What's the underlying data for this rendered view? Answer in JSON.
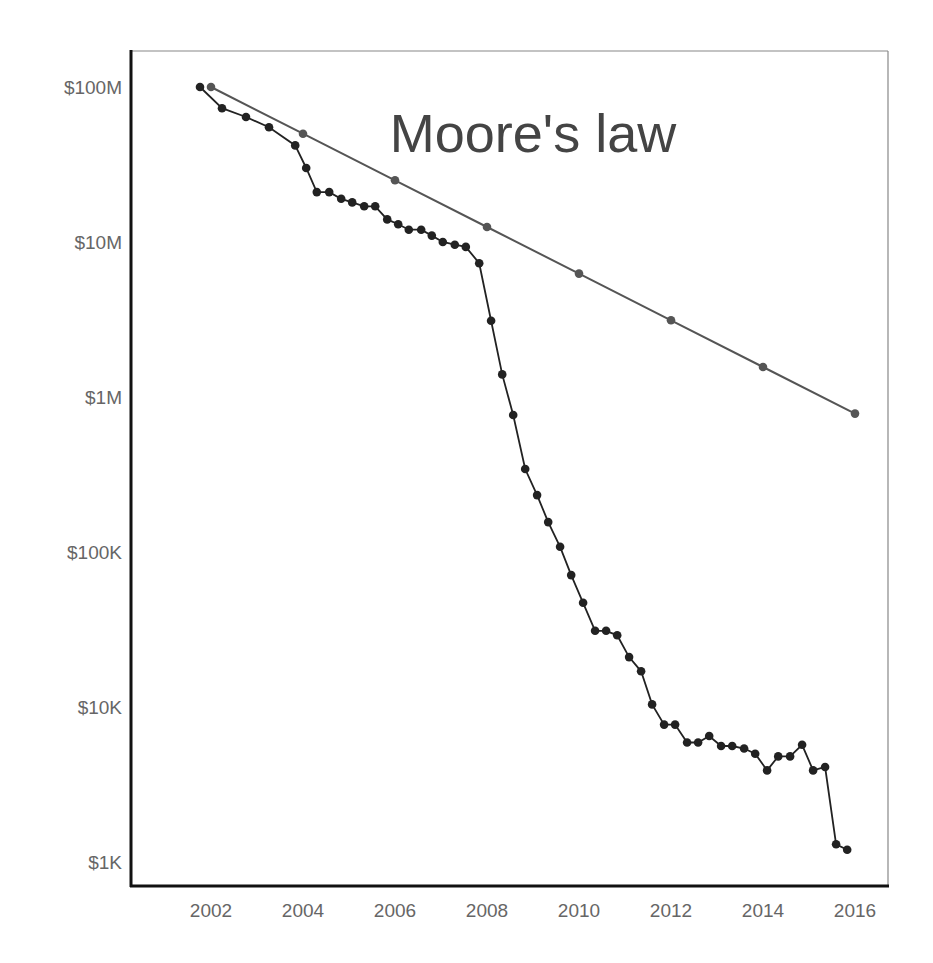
{
  "chart_data": {
    "type": "line",
    "title": "Moore's law",
    "xlabel": "",
    "ylabel": "",
    "yscale": "log",
    "xlim": [
      2000.6,
      2016.7
    ],
    "ylim": [
      900,
      160000000
    ],
    "grid": false,
    "legend": "none",
    "x_ticks": [
      2002,
      2004,
      2006,
      2008,
      2010,
      2012,
      2014,
      2016
    ],
    "x_tick_labels": [
      "2002",
      "2004",
      "2006",
      "2008",
      "2010",
      "2012",
      "2014",
      "2016"
    ],
    "y_ticks": [
      100000000,
      10000000,
      1000000,
      100000,
      10000,
      1000
    ],
    "y_tick_labels": [
      "$100M",
      "$10M",
      "$1M",
      "$100K",
      "$10K",
      "$1K"
    ],
    "series": [
      {
        "name": "Actual cost",
        "color": "#222222",
        "x": [
          2001.76,
          2002.24,
          2002.76,
          2003.26,
          2003.83,
          2004.07,
          2004.3,
          2004.57,
          2004.83,
          2005.07,
          2005.33,
          2005.57,
          2005.83,
          2006.07,
          2006.3,
          2006.57,
          2006.8,
          2007.04,
          2007.3,
          2007.54,
          2007.83,
          2008.09,
          2008.33,
          2008.57,
          2008.83,
          2009.09,
          2009.33,
          2009.59,
          2009.83,
          2010.09,
          2010.35,
          2010.59,
          2010.83,
          2011.09,
          2011.35,
          2011.59,
          2011.85,
          2012.09,
          2012.35,
          2012.59,
          2012.83,
          2013.09,
          2013.33,
          2013.59,
          2013.83,
          2014.09,
          2014.33,
          2014.59,
          2014.85,
          2015.09,
          2015.35,
          2015.59,
          2015.83
        ],
        "values": [
          100000000,
          73000000,
          64000000,
          55000000,
          42000000,
          30000000,
          21000000,
          21000000,
          19000000,
          18000000,
          17000000,
          17000000,
          14000000,
          13000000,
          12000000,
          12000000,
          11000000,
          10000000,
          9600000,
          9300000,
          7300000,
          3100000,
          1400000,
          765000,
          343000,
          233000,
          156000,
          108000,
          71000,
          47000,
          31000,
          31000,
          29000,
          21000,
          17000,
          10400,
          7700,
          7700,
          5900,
          5900,
          6500,
          5600,
          5600,
          5400,
          5000,
          3900,
          4800,
          4800,
          5700,
          3900,
          4100,
          1300,
          1200
        ]
      },
      {
        "name": "Moore's law",
        "color": "#555555",
        "x": [
          2002,
          2004,
          2006,
          2008,
          2010,
          2012,
          2014,
          2016
        ],
        "values": [
          100000000,
          50000000,
          25000000,
          12500000,
          6250000,
          3125000,
          1562500,
          781250
        ]
      }
    ]
  }
}
